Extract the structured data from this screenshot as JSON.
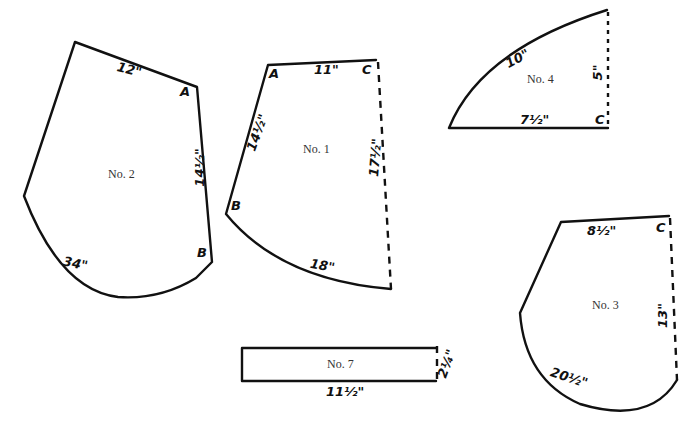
{
  "pieces": [
    {
      "name": "No. 2",
      "points": {
        "A": "A",
        "B": "B"
      },
      "measurements": {
        "top": "12\"",
        "right": "14½\"",
        "curve": "34\""
      }
    },
    {
      "name": "No. 1",
      "points": {
        "A": "A",
        "B": "B",
        "C": "C"
      },
      "measurements": {
        "top": "11\"",
        "left": "14½\"",
        "right_fold": "17½\"",
        "curve": "18\""
      }
    },
    {
      "name": "No. 4",
      "points": {
        "C": "C"
      },
      "measurements": {
        "curve": "10\"",
        "bottom": "7½\"",
        "right_fold": "5\""
      }
    },
    {
      "name": "No. 3",
      "points": {
        "C": "C"
      },
      "measurements": {
        "top": "8½\"",
        "right_fold": "13\"",
        "curve": "20½\""
      }
    },
    {
      "name": "No. 7",
      "measurements": {
        "bottom": "11½\"",
        "right_fold": "2¼\""
      }
    }
  ],
  "colors": {
    "line": "#111111",
    "background": "#ffffff"
  }
}
